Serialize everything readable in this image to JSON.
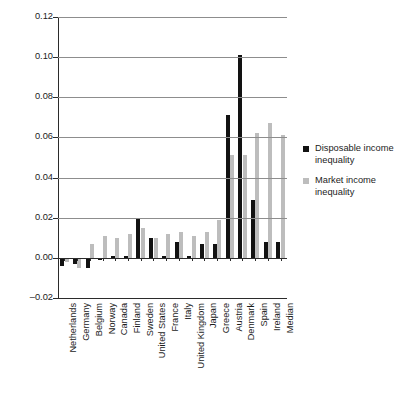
{
  "chart_data": {
    "type": "bar",
    "title": "",
    "subtitle": "",
    "xlabel": "",
    "ylabel": "",
    "ylim": [
      -0.02,
      0.12
    ],
    "ytick_step": 0.02,
    "yticks": [
      "0.12",
      "0.10",
      "0.08",
      "0.06",
      "0.04",
      "0.02",
      "0.00",
      "-0.02"
    ],
    "ytick_values": [
      0.12,
      0.1,
      0.08,
      0.06,
      0.04,
      0.02,
      0.0,
      -0.02
    ],
    "grid": true,
    "grid_axis": "y",
    "legend_position": "right",
    "categories": [
      "Netherlands",
      "Germany",
      "Belgium",
      "Norway",
      "Canada",
      "Finland",
      "Sweden",
      "United States",
      "France",
      "Italy",
      "United Kingdom",
      "Japan",
      "Greece",
      "Austria",
      "Denmark",
      "Spain",
      "Ireland",
      "Median"
    ],
    "series": [
      {
        "name": "Disposable income inequality",
        "color": "#121212",
        "values": [
          -0.004,
          -0.003,
          -0.005,
          -0.001,
          0.001,
          0.001,
          0.02,
          0.01,
          0.001,
          0.008,
          0.001,
          0.007,
          0.007,
          0.071,
          0.101,
          0.029,
          0.008,
          0.008
        ]
      },
      {
        "name": "Market income inequality",
        "color": "#bdbdbd",
        "values": [
          -0.002,
          -0.005,
          0.007,
          0.011,
          0.01,
          0.012,
          0.015,
          0.01,
          0.012,
          0.013,
          0.011,
          0.013,
          0.019,
          0.051,
          0.051,
          0.062,
          0.067,
          0.061
        ]
      }
    ]
  },
  "legend": {
    "items": [
      {
        "label_line1": "Disposable income",
        "label_line2": "inequality",
        "color": "#121212"
      },
      {
        "label_line1": "Market income",
        "label_line2": "inequality",
        "color": "#bdbdbd"
      }
    ]
  }
}
